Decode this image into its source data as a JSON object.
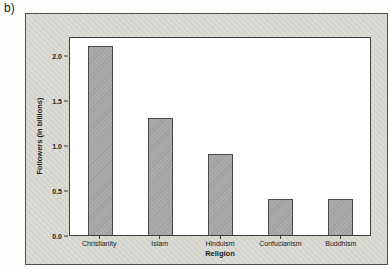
{
  "figure": {
    "label": "b)"
  },
  "chart_data": {
    "type": "bar",
    "title": "",
    "categories": [
      "Christianity",
      "Islam",
      "Hinduism",
      "Confucianism",
      "Buddhism"
    ],
    "values": [
      2.1,
      1.3,
      0.9,
      0.4,
      0.4
    ],
    "xlabel": "Religion",
    "ylabel": "Followers (in billions)",
    "yticks": [
      "0.0",
      "0.5",
      "1.0",
      "1.5",
      "2.0"
    ],
    "ylim": [
      0,
      2.21
    ],
    "grid": false,
    "legend_position": "none",
    "colors": {
      "bar_fill": "#a7a7a7",
      "bar_border": "#4a4a4a",
      "figure_background": "#d8d7d1",
      "plot_background": "#ffffff",
      "axis_line": "#3d3d3d",
      "text": "#222222"
    }
  }
}
